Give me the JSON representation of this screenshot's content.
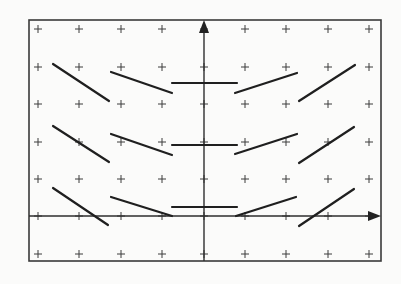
{
  "diagram": {
    "type": "slope-field",
    "colors": {
      "background": "#fbfbfa",
      "stroke": "#1f1f1f",
      "frame": "#3a3a3a"
    },
    "frame": {
      "x1": 29,
      "y1": 20,
      "x2": 381,
      "y2": 261
    },
    "axes": {
      "x_axis": {
        "y": 216,
        "x_start": 29,
        "x_end": 381,
        "arrow": "right"
      },
      "y_axis": {
        "x": 204,
        "y_start": 261,
        "y_end": 20,
        "arrow": "up"
      }
    },
    "grid": {
      "columns": [
        38,
        79,
        121,
        162,
        204,
        245,
        286,
        328,
        369
      ],
      "rows": [
        29,
        67,
        104,
        142,
        179,
        216,
        254
      ],
      "marker": "plus"
    },
    "segments": [
      {
        "row": 1,
        "col": 1,
        "x1": 53,
        "y1": 64,
        "x2": 109,
        "y2": 101
      },
      {
        "row": 1,
        "col": 2,
        "x1": 111,
        "y1": 72,
        "x2": 172,
        "y2": 93
      },
      {
        "row": 1,
        "col": 3,
        "x1": 172,
        "y1": 83,
        "x2": 237,
        "y2": 83
      },
      {
        "row": 1,
        "col": 4,
        "x1": 235,
        "y1": 93,
        "x2": 297,
        "y2": 73
      },
      {
        "row": 1,
        "col": 5,
        "x1": 299,
        "y1": 101,
        "x2": 355,
        "y2": 65
      },
      {
        "row": 2,
        "col": 1,
        "x1": 53,
        "y1": 126,
        "x2": 109,
        "y2": 162
      },
      {
        "row": 2,
        "col": 2,
        "x1": 111,
        "y1": 134,
        "x2": 172,
        "y2": 155
      },
      {
        "row": 2,
        "col": 3,
        "x1": 172,
        "y1": 145,
        "x2": 237,
        "y2": 145
      },
      {
        "row": 2,
        "col": 4,
        "x1": 235,
        "y1": 154,
        "x2": 297,
        "y2": 134
      },
      {
        "row": 2,
        "col": 5,
        "x1": 299,
        "y1": 163,
        "x2": 354,
        "y2": 127
      },
      {
        "row": 3,
        "col": 1,
        "x1": 53,
        "y1": 188,
        "x2": 108,
        "y2": 225
      },
      {
        "row": 3,
        "col": 2,
        "x1": 111,
        "y1": 197,
        "x2": 172,
        "y2": 216
      },
      {
        "row": 3,
        "col": 3,
        "x1": 172,
        "y1": 207,
        "x2": 237,
        "y2": 207
      },
      {
        "row": 3,
        "col": 4,
        "x1": 236,
        "y1": 216,
        "x2": 296,
        "y2": 197
      },
      {
        "row": 3,
        "col": 5,
        "x1": 299,
        "y1": 226,
        "x2": 354,
        "y2": 189
      }
    ]
  }
}
